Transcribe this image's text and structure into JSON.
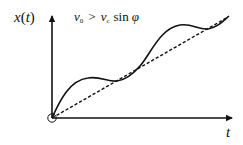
{
  "diagram": {
    "y_axis_label": {
      "main": "x",
      "open": "(",
      "arg": "t",
      "close": ")"
    },
    "x_axis_label": "t",
    "condition": {
      "lhs_var": "v",
      "lhs_sub": "0",
      "operator": ">",
      "rhs_var": "v",
      "rhs_sub": "c",
      "func": "sin",
      "angle": "φ"
    },
    "elements": {
      "origin_marker": "open-circle",
      "reference_line": "dashed straight line from origin",
      "trajectory": "oscillating solid curve around reference line"
    },
    "colors": {
      "stroke": "#111111",
      "background": "#ffffff"
    }
  }
}
